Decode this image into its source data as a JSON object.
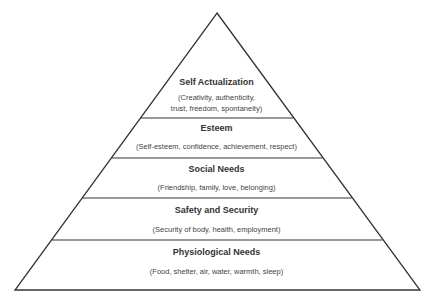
{
  "diagram": {
    "type": "pyramid",
    "colors": {
      "stroke": "#333333",
      "fill": "#ffffff"
    },
    "levels": [
      {
        "title": "Self Actualization",
        "description_lines": [
          "(Creativity, authenticity,",
          "trust, freedom, spontaneity)"
        ]
      },
      {
        "title": "Esteem",
        "description_lines": [
          "(Self-esteem, confidence, achievement, respect)"
        ]
      },
      {
        "title": "Social Needs",
        "description_lines": [
          "(Friendship, family, love, belonging)"
        ]
      },
      {
        "title": "Safety and Security",
        "description_lines": [
          "(Security of body, health, employment)"
        ]
      },
      {
        "title": "Physiological Needs",
        "description_lines": [
          "(Food, shelter, air, water, warmth, sleep)"
        ]
      }
    ]
  }
}
